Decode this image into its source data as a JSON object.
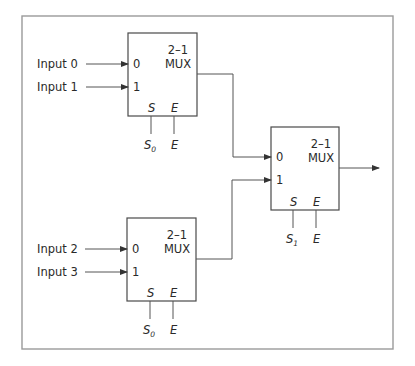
{
  "diagram": {
    "colors": {
      "frame": "#9a9a9a",
      "box": "#4a4a4a",
      "wire": "#555555"
    },
    "muxes": [
      {
        "id": "mux-top",
        "title_line1": "2–1",
        "title_line2": "MUX",
        "in0_label": "0",
        "in1_label": "1",
        "select_label": "S",
        "enable_label": "E",
        "select_signal": "S",
        "select_subscript": "0",
        "enable_signal": "E"
      },
      {
        "id": "mux-bottom",
        "title_line1": "2–1",
        "title_line2": "MUX",
        "in0_label": "0",
        "in1_label": "1",
        "select_label": "S",
        "enable_label": "E",
        "select_signal": "S",
        "select_subscript": "0",
        "enable_signal": "E"
      },
      {
        "id": "mux-output",
        "title_line1": "2–1",
        "title_line2": "MUX",
        "in0_label": "0",
        "in1_label": "1",
        "select_label": "S",
        "enable_label": "E",
        "select_signal": "S",
        "select_subscript": "1",
        "enable_signal": "E"
      }
    ],
    "inputs": [
      "Input 0",
      "Input 1",
      "Input 2",
      "Input 3"
    ]
  }
}
